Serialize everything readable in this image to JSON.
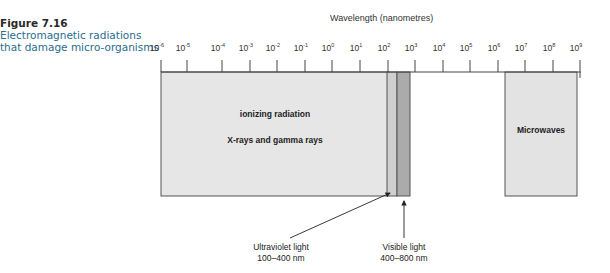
{
  "caption": {
    "number": "Figure 7.16",
    "description": "Electromagnetic radiations that damage micro-organisms"
  },
  "axis": {
    "title": "Wavelength (nanometres)",
    "base": "10",
    "exponents": [
      "-6",
      "-5",
      "-4",
      "-3",
      "-2",
      "-1",
      "0",
      "1",
      "2",
      "3",
      "4",
      "5",
      "6",
      "7",
      "8",
      "9"
    ]
  },
  "regions": {
    "ionizing": {
      "line1": "ionizing radiation",
      "line2": "X-rays and gamma rays",
      "color": "#e6e6e6"
    },
    "ultraviolet": {
      "label": "Ultraviolet light",
      "range": "100–400 nm",
      "color": "#cfcfcf"
    },
    "visible": {
      "label": "Visible light",
      "range": "400–800 nm",
      "color": "#ababab"
    },
    "microwaves": {
      "label": "Microwaves",
      "color": "#e3e3e3"
    }
  },
  "chart_data": {
    "type": "table",
    "title": "Electromagnetic radiations that damage micro-organisms",
    "xlabel": "Wavelength (nanometres)",
    "scale": "log10",
    "x_ticks": [
      "10^-6",
      "10^-5",
      "10^-4",
      "10^-3",
      "10^-2",
      "10^-1",
      "10^0",
      "10^1",
      "10^2",
      "10^3",
      "10^4",
      "10^5",
      "10^6",
      "10^7",
      "10^8",
      "10^9"
    ],
    "xlim": [
      1e-06,
      1000000000.0
    ],
    "bands": [
      {
        "name": "Ionizing radiation (X-rays and gamma rays)",
        "from_nm": 1e-06,
        "to_nm": 100
      },
      {
        "name": "Ultraviolet light",
        "from_nm": 100,
        "to_nm": 400,
        "label": "100–400 nm"
      },
      {
        "name": "Visible light",
        "from_nm": 400,
        "to_nm": 800,
        "label": "400–800 nm"
      },
      {
        "name": "Microwaves",
        "from_nm": 1500000.0,
        "to_nm": 1000000000.0
      }
    ]
  }
}
